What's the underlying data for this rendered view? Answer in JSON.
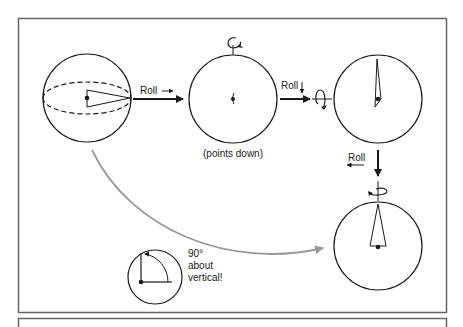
{
  "diagram": {
    "colors": {
      "stroke": "#1a1a1a",
      "frame": "#555555",
      "curve": "#999999"
    },
    "labels": {
      "roll_1": "Roll",
      "roll_2": "Roll",
      "roll_3": "Roll",
      "points_down": "(points down)",
      "inset_line1": "90°",
      "inset_line2": "about",
      "inset_line3": "vertical!"
    },
    "spheres": [
      {
        "name": "initial-sphere",
        "view": "side, equator dashed, pointer horizontal"
      },
      {
        "name": "sphere-points-down",
        "view": "top, pointer points down"
      },
      {
        "name": "sphere-pointer-up-thin",
        "view": "pointer rolled up"
      },
      {
        "name": "sphere-final",
        "view": "pointer vertical"
      }
    ]
  }
}
